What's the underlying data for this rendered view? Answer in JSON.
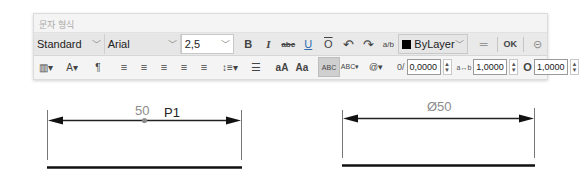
{
  "panel": {
    "title": "문자 형식",
    "row1": {
      "style_select": "Standard",
      "font_select": "Arial",
      "height_select": "2,5",
      "bold": "B",
      "italic": "I",
      "strikethrough": "abc",
      "underline": "U",
      "overline": "O",
      "undo": "↶",
      "redo": "↷",
      "stack": "a/b",
      "color_select": "ByLayer",
      "ruler": "═",
      "ok": "OK",
      "options": "⊝"
    },
    "row2": {
      "columns": "▥▾",
      "mtext_justify": "A▾",
      "paragraph": "¶",
      "align_left": "≡",
      "align_center": "≡",
      "align_right": "≡",
      "align_justify": "≡",
      "align_distribute": "≡",
      "line_spacing": "↕≡▾",
      "numbering": "☰",
      "uppercase": "aA",
      "lowercase": "Aa",
      "spell_check": "ABC",
      "spell_settings": "ABC▾",
      "symbol": "@▾",
      "oblique_label": "0/",
      "oblique_value": "0,0000",
      "tracking_label": "a↔b",
      "tracking_value": "1,0000",
      "width_label": "O",
      "width_value": "1,0000"
    }
  },
  "drawing": {
    "left_dimension": {
      "text": "50",
      "point_label": "P1"
    },
    "right_dimension": {
      "text": "Ø50"
    }
  },
  "colors": {
    "dim_text": "#8c8c8c",
    "lines": "#000000"
  }
}
